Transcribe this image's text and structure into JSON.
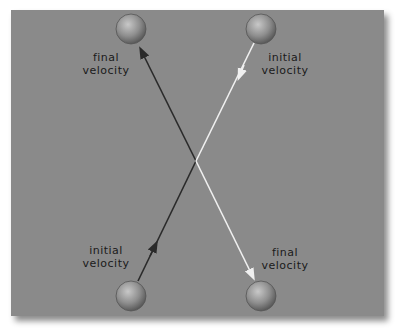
{
  "diagram": {
    "background_color": "#8a8a8a",
    "balls": [
      {
        "id": "ball-top-left",
        "role": "final position of ball A"
      },
      {
        "id": "ball-top-right",
        "role": "initial position of ball B"
      },
      {
        "id": "ball-bottom-left",
        "role": "initial position of ball A"
      },
      {
        "id": "ball-bottom-right",
        "role": "final position of ball B"
      }
    ],
    "labels": {
      "top_left": {
        "line1": "final",
        "line2": "velocity"
      },
      "top_right": {
        "line1": "initial",
        "line2": "velocity"
      },
      "bottom_left": {
        "line1": "initial",
        "line2": "velocity"
      },
      "bottom_right": {
        "line1": "final",
        "line2": "velocity"
      }
    },
    "paths": [
      {
        "name": "dark-path",
        "color": "#2a2a2a",
        "from": "bottom-left ball",
        "to": "top-left ball",
        "description": "ball A moves up, deflects at center"
      },
      {
        "name": "light-path",
        "color": "#f0f0f0",
        "from": "top-right ball",
        "to": "bottom-right ball",
        "description": "ball B moves down, deflects at center"
      }
    ]
  }
}
